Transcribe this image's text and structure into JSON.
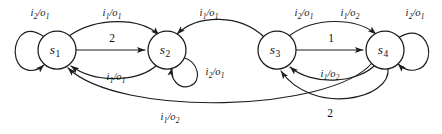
{
  "diagram": {
    "type": "finite-state-machine",
    "width": 442,
    "height": 134,
    "stroke_color": "#1d1d1d",
    "background_color": "#ffffff",
    "states": [
      {
        "id": "s1",
        "label_base": "s",
        "label_sub": "1",
        "cx": 57,
        "cy": 50,
        "r": 19
      },
      {
        "id": "s2",
        "label_base": "s",
        "label_sub": "2",
        "cx": 167,
        "cy": 50,
        "r": 19
      },
      {
        "id": "s3",
        "label_base": "s",
        "label_sub": "3",
        "cx": 277,
        "cy": 50,
        "r": 19
      },
      {
        "id": "s4",
        "label_base": "s",
        "label_sub": "4",
        "cx": 385,
        "cy": 50,
        "r": 19
      }
    ],
    "transitions": [
      {
        "id": "t1",
        "from": "s1",
        "to": "s1",
        "kind": "self-loop",
        "label_pre": "i",
        "label_pre_sub": "2",
        "label_post": "o",
        "label_post_sub": "1",
        "label_text": "i2/o1",
        "lx": 40,
        "ly": 14
      },
      {
        "id": "t2",
        "from": "s1",
        "to": "s2",
        "kind": "arc-top",
        "label_pre": "i",
        "label_pre_sub": "1",
        "label_post": "o",
        "label_post_sub": "1",
        "label_text": "i1/o1",
        "lx": 112,
        "ly": 14
      },
      {
        "id": "t3",
        "from": "s1",
        "to": "s2",
        "kind": "straight",
        "label_text": "2",
        "numeric": true,
        "lx": 112,
        "ly": 39
      },
      {
        "id": "t4",
        "from": "s2",
        "to": "s1",
        "kind": "arc-bottom",
        "label_pre": "i",
        "label_pre_sub": "1",
        "label_post": "o",
        "label_post_sub": "1",
        "label_text": "i1/o1",
        "lx": 116,
        "ly": 78
      },
      {
        "id": "t5",
        "from": "s2",
        "to": "s2",
        "kind": "self-loop-right",
        "label_pre": "i",
        "label_pre_sub": "2",
        "label_post": "o",
        "label_post_sub": "1",
        "label_text": "i2/o1",
        "lx": 215,
        "ly": 73
      },
      {
        "id": "t6",
        "from": "s3",
        "to": "s2",
        "kind": "arc-top-back",
        "label_pre": "i",
        "label_pre_sub": "1",
        "label_post": "o",
        "label_post_sub": "1",
        "label_text": "i1/o1",
        "lx": 209,
        "ly": 14
      },
      {
        "id": "t7",
        "from": "s3",
        "to": "s4",
        "kind": "arc-top",
        "label_pre": "i",
        "label_pre_sub": "2",
        "label_post": "o",
        "label_post_sub": "1",
        "label_text": "i2/o1",
        "lx": 304,
        "ly": 14
      },
      {
        "id": "t8",
        "from": "s3",
        "to": "s4",
        "kind": "arc-top-second",
        "label_pre": "i",
        "label_pre_sub": "1",
        "label_post": "o",
        "label_post_sub": "2",
        "label_text": "i1/o2",
        "lx": 350,
        "ly": 14
      },
      {
        "id": "t9",
        "from": "s3",
        "to": "s4",
        "kind": "straight",
        "label_text": "1",
        "numeric": true,
        "lx": 331,
        "ly": 39
      },
      {
        "id": "t10",
        "from": "s4",
        "to": "s3",
        "kind": "arc-bottom-inner",
        "label_pre": "i",
        "label_pre_sub": "1",
        "label_post": "o",
        "label_post_sub": "2",
        "label_text": "i1/o2",
        "lx": 330,
        "ly": 75
      },
      {
        "id": "t11",
        "from": "s4",
        "to": "s3",
        "kind": "arc-bottom-outer",
        "label_text": "2",
        "numeric": true,
        "lx": 330,
        "ly": 114
      },
      {
        "id": "t12",
        "from": "s4",
        "to": "s4",
        "kind": "self-loop-right",
        "label_pre": "i",
        "label_pre_sub": "2",
        "label_post": "o",
        "label_post_sub": "1",
        "label_text": "i2/o1",
        "lx": 415,
        "ly": 14
      },
      {
        "id": "t13",
        "from": "s4",
        "to": "s1",
        "kind": "arc-long-bottom",
        "label_pre": "i",
        "label_pre_sub": "1",
        "label_post": "o",
        "label_post_sub": "2",
        "label_text": "i1/o2",
        "lx": 170,
        "ly": 118
      }
    ]
  }
}
